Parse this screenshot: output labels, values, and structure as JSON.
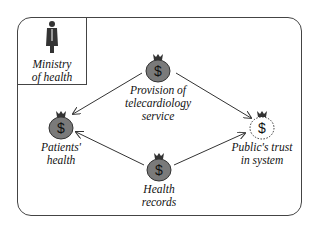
{
  "diagram": {
    "actor": {
      "icon": "person-in-suit-icon",
      "label_lines": [
        "Ministry",
        "of health"
      ]
    },
    "nodes": [
      {
        "id": "provision",
        "icon": "money-bag-icon",
        "style": "filled",
        "label_lines": [
          "Provision of",
          "telecardiology",
          "service"
        ]
      },
      {
        "id": "patients",
        "icon": "money-bag-icon",
        "style": "filled",
        "label_lines": [
          "Patients'",
          "health"
        ]
      },
      {
        "id": "records",
        "icon": "money-bag-icon",
        "style": "filled",
        "label_lines": [
          "Health",
          "records"
        ]
      },
      {
        "id": "trust",
        "icon": "money-bag-icon",
        "style": "dashed-outline",
        "label_lines": [
          "Public's trust",
          "in system"
        ]
      }
    ],
    "edges": [
      {
        "from": "provision",
        "to": "patients"
      },
      {
        "from": "provision",
        "to": "trust"
      },
      {
        "from": "records",
        "to": "patients"
      },
      {
        "from": "records",
        "to": "trust"
      }
    ],
    "colors": {
      "bag_fill": "#7a7a7a",
      "line": "#333333"
    }
  }
}
